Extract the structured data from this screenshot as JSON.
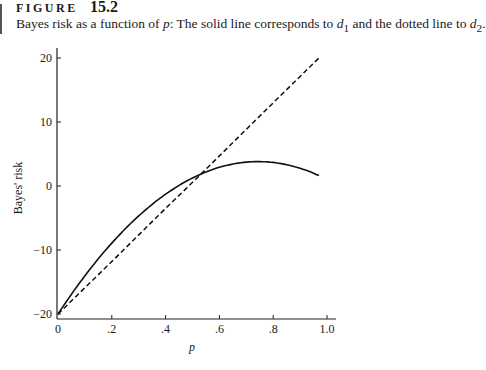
{
  "figure": {
    "label": "FIGURE",
    "number": "15.2",
    "caption_pre": "Bayes risk as a function of ",
    "caption_var": "p",
    "caption_mid": ": The solid line corresponds to ",
    "caption_d1": "d",
    "caption_d1_sub": "1",
    "caption_and": " and the dotted line to ",
    "caption_d2": "d",
    "caption_d2_sub": "2",
    "caption_end": "."
  },
  "chart_data": {
    "type": "line",
    "title": "Bayes risk as a function of p",
    "xlabel": "p",
    "ylabel": "Bayes' risk",
    "xlim": [
      0,
      1.0
    ],
    "ylim": [
      -20,
      20
    ],
    "x_ticks": [
      "0",
      ".2",
      ".4",
      ".6",
      ".8",
      "1.0"
    ],
    "y_ticks": [
      "20",
      "10",
      "0",
      "−10",
      "−20"
    ],
    "grid": false,
    "legend": "none (described in caption)",
    "series": [
      {
        "name": "d1",
        "style": "solid",
        "x": [
          0,
          0.1,
          0.2,
          0.3,
          0.4,
          0.5,
          0.53,
          0.6,
          0.7,
          0.74,
          0.8,
          0.9,
          0.97
        ],
        "y": [
          -20,
          -14.0,
          -8.9,
          -4.7,
          -1.3,
          1.3,
          1.8,
          2.9,
          3.7,
          3.8,
          3.7,
          2.8,
          1.6
        ]
      },
      {
        "name": "d2",
        "style": "dashed",
        "x": [
          0,
          0.2,
          0.4,
          0.53,
          0.6,
          0.8,
          0.97
        ],
        "y": [
          -20,
          -11.8,
          -3.5,
          1.8,
          4.7,
          13.0,
          20
        ]
      }
    ]
  }
}
